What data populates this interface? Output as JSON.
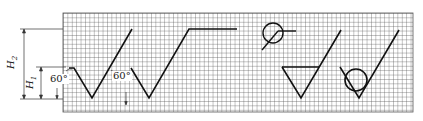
{
  "figure": {
    "grid": {
      "x": 63,
      "y": 13,
      "width": 350,
      "height": 99,
      "cell": 4.4,
      "line_color": "#444444"
    },
    "dimensions": [
      {
        "name": "H2",
        "label": "H",
        "subscript": "2"
      },
      {
        "name": "H1",
        "label": "H",
        "subscript": "1"
      }
    ],
    "angles": [
      {
        "label": "60°"
      },
      {
        "label": "60°"
      }
    ],
    "symbols": [
      {
        "name": "basic-symbol",
        "type": "check-mark"
      },
      {
        "name": "extended-symbol",
        "type": "check-mark-with-horizontal-line"
      },
      {
        "name": "all-around-circle",
        "type": "circle-with-leader"
      },
      {
        "name": "material-removal-symbol",
        "type": "check-mark-with-bar"
      },
      {
        "name": "no-material-removal-symbol",
        "type": "check-mark-with-circle"
      }
    ],
    "colors": {
      "stroke": "#111111",
      "background": "#ffffff",
      "grid": "#555555"
    }
  }
}
